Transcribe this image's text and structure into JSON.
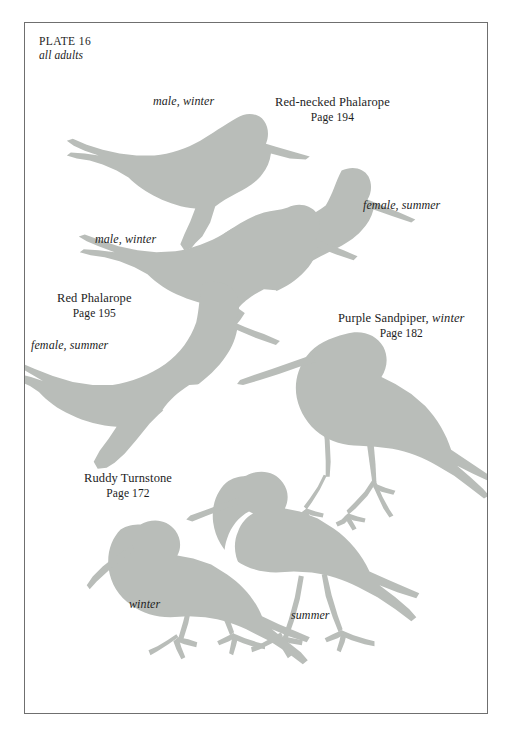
{
  "page": {
    "plate_number": "PLATE 16",
    "subtitle": "all adults",
    "background_color": "#ffffff",
    "frame_color": "#6f6f6f",
    "silhouette_color": "#b9bdb9"
  },
  "species": [
    {
      "id": "red-necked-phalarope",
      "name": "Red-necked Phalarope",
      "page": "Page 194",
      "morphs": [
        "male, winter",
        "female, summer"
      ]
    },
    {
      "id": "red-phalarope",
      "name": "Red Phalarope",
      "page": "Page 195",
      "morphs": [
        "male, winter",
        "female, summer"
      ]
    },
    {
      "id": "purple-sandpiper",
      "name": "Purple Sandpiper",
      "name_suffix": "winter",
      "page": "Page 182",
      "morphs": []
    },
    {
      "id": "ruddy-turnstone",
      "name": "Ruddy Turnstone",
      "page": "Page 172",
      "morphs": [
        "winter",
        "summer"
      ]
    }
  ],
  "labels": {
    "rnph_name": "Red-necked Phalarope",
    "rnph_page": "Page 194",
    "rnph_male": "male, winter",
    "rnph_female": "female, summer",
    "rph_name": "Red Phalarope",
    "rph_page": "Page 195",
    "rph_male": "male, winter",
    "rph_female": "female, summer",
    "pusa_name": "Purple Sandpiper,",
    "pusa_name_suffix": "winter",
    "pusa_page": "Page 182",
    "rutu_name": "Ruddy Turnstone",
    "rutu_page": "Page 172",
    "rutu_winter": "winter",
    "rutu_summer": "summer"
  },
  "figures": [
    {
      "name": "red-necked-phalarope-male-winter-silhouette"
    },
    {
      "name": "red-necked-phalarope-female-summer-silhouette"
    },
    {
      "name": "red-phalarope-male-winter-silhouette"
    },
    {
      "name": "red-phalarope-female-summer-silhouette"
    },
    {
      "name": "purple-sandpiper-winter-silhouette"
    },
    {
      "name": "ruddy-turnstone-winter-silhouette"
    },
    {
      "name": "ruddy-turnstone-summer-silhouette"
    }
  ]
}
